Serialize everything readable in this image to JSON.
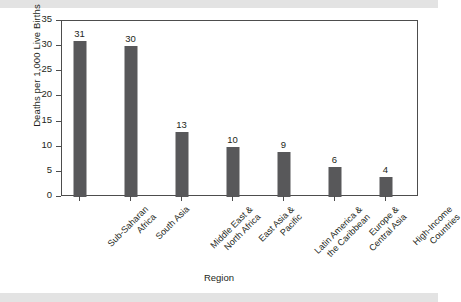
{
  "chart_data": {
    "type": "bar",
    "title": "",
    "xlabel": "Region",
    "ylabel": "Deaths per 1,000 Live Births",
    "ylim": [
      0,
      35
    ],
    "yticks": [
      0,
      5,
      10,
      15,
      20,
      25,
      30,
      35
    ],
    "ytick_labels": [
      "0",
      "5",
      "10",
      "15",
      "20",
      "25",
      "30",
      "35"
    ],
    "grid": false,
    "legend": null,
    "bar_color": "#58585a",
    "frame_color": "#4d4d4d",
    "label_rotation": -45,
    "categories": [
      "Sub-Saharan Africa",
      "South Asia",
      "Middle East & North Africa",
      "East Asia & Pacific",
      "Latin America & the Caribbean",
      "Europe & Central Asia",
      "High-Income Countries"
    ],
    "category_lines": [
      [
        "Sub-Saharan",
        "Africa"
      ],
      [
        "South Asia",
        ""
      ],
      [
        "Middle East &",
        "North Africa"
      ],
      [
        "East Asia &",
        "Pacific"
      ],
      [
        "Latin America &",
        "the Caribbean"
      ],
      [
        "Europe &",
        "Central Asia"
      ],
      [
        "High-Income",
        "Countries"
      ]
    ],
    "values": [
      31,
      30,
      13,
      10,
      9,
      6,
      4
    ],
    "value_labels": [
      "31",
      "30",
      "13",
      "10",
      "9",
      "6",
      "4"
    ]
  }
}
